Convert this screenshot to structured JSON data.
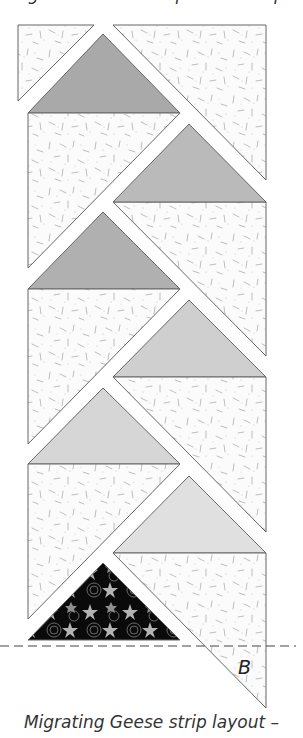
{
  "top_text": "ing Geese to the top of the strip.",
  "caption": "Migrating Geese strip layout –",
  "label_b": "B",
  "colors": {
    "background_fabric": "#fbfbfb",
    "speckle": "#b9b9b9",
    "outline": "#666666",
    "goose_1": "#a9a9a9",
    "goose_2": "#bababa",
    "goose_3": "#b0b0b0",
    "goose_4": "#cfcfcf",
    "goose_5": "#d6d6d6",
    "goose_6": "#e0e0e0",
    "floral_base": "#0a0a0a",
    "floral_leaf": "#b0b0b0"
  },
  "geese": [
    {
      "id": "goose-1",
      "position": "left",
      "fill": "floral-gray-dark"
    },
    {
      "id": "goose-2",
      "position": "right"
    },
    {
      "id": "goose-3",
      "position": "left"
    },
    {
      "id": "goose-4",
      "position": "right"
    },
    {
      "id": "goose-5",
      "position": "left"
    },
    {
      "id": "goose-6",
      "position": "right"
    },
    {
      "id": "goose-7",
      "position": "left",
      "fill": "black-floral"
    }
  ]
}
